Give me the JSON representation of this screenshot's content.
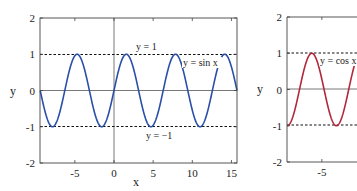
{
  "chart_data": [
    {
      "type": "line",
      "title": "",
      "xlabel": "x",
      "ylabel": "y",
      "xlim": [
        -9.42,
        15.71
      ],
      "ylim": [
        -2,
        2
      ],
      "xticks": [
        -5,
        0,
        5,
        10,
        15
      ],
      "xtick_labels": [
        "-5",
        "0",
        "5",
        "10",
        "15"
      ],
      "yticks": [
        -2,
        -1,
        0,
        1,
        2
      ],
      "ytick_labels": [
        "-2",
        "-1",
        "0",
        "1",
        "2"
      ],
      "grid": false,
      "series": [
        {
          "name": "y = sin x",
          "function": "sin",
          "color": "#2a4fa8"
        }
      ],
      "reference_lines": [
        {
          "y": 1,
          "style": "dashed",
          "label": "y = 1"
        },
        {
          "y": -1,
          "style": "dashed",
          "label": "y = −1"
        }
      ],
      "annotations": [
        "y = 1",
        "y = sin x",
        "y = −1"
      ]
    },
    {
      "type": "line",
      "title": "",
      "xlabel": "",
      "ylabel": "y",
      "xlim": [
        -9.42,
        -0.5
      ],
      "ylim": [
        -2,
        2
      ],
      "xticks": [
        -5
      ],
      "xtick_labels": [
        "-5"
      ],
      "yticks": [
        -2,
        -1,
        0,
        1,
        2
      ],
      "ytick_labels": [
        "-2",
        "-1",
        "0",
        "1",
        "2"
      ],
      "grid": false,
      "series": [
        {
          "name": "y = cos x",
          "function": "cos",
          "color": "#b0283a"
        }
      ],
      "reference_lines": [
        {
          "y": 1,
          "style": "dashed"
        },
        {
          "y": -1,
          "style": "dashed"
        }
      ],
      "annotations": [
        "y = cos x"
      ]
    }
  ]
}
